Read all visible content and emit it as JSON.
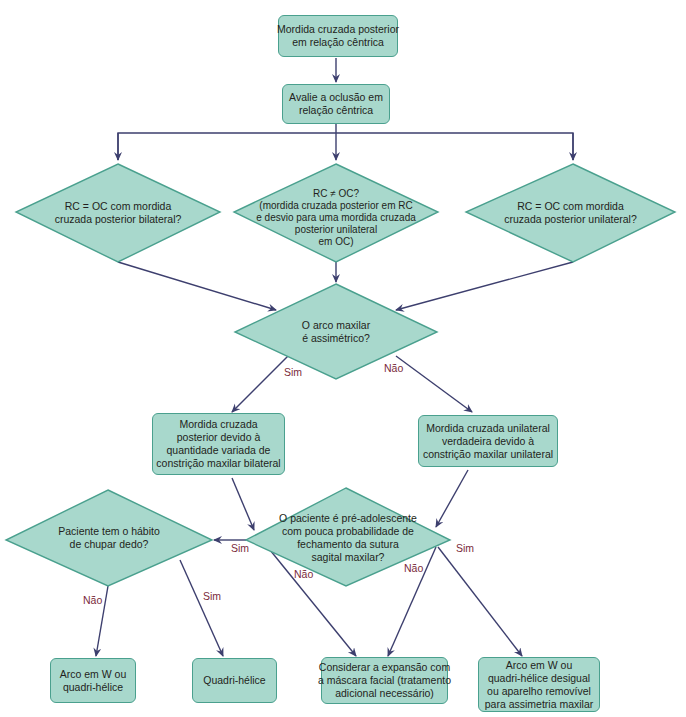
{
  "colors": {
    "node_fill": "#a8d8cc",
    "node_border": "#4aa08e",
    "arrow": "#3d3f6e",
    "label_text": "#7a2a3a"
  },
  "nodes": {
    "start": {
      "lines": [
        "Mordida cruzada posterior",
        "em relação cêntrica"
      ]
    },
    "evaluate": {
      "lines": [
        "Avalie a oclusão em",
        "relação cêntrica"
      ]
    },
    "bilateral_q": {
      "lines": [
        "RC = OC com mordida",
        "cruzada posterior bilateral?"
      ]
    },
    "shift_q": {
      "lines": [
        "RC ≠ OC?",
        "(mordida cruzada posterior em RC",
        "e desvio para uma mordida cruzada",
        "posterior unilateral",
        "em OC)"
      ]
    },
    "unilateral_q": {
      "lines": [
        "RC = OC com mordida",
        "cruzada posterior unilateral?"
      ]
    },
    "asymmetric_q": {
      "lines": [
        "O arco maxilar",
        "é assimétrico?"
      ]
    },
    "bilateral_constriction": {
      "lines": [
        "Mordida cruzada",
        "posterior devido à",
        "quantidade variada de",
        "constrição maxilar bilateral"
      ]
    },
    "unilateral_constriction": {
      "lines": [
        "Mordida cruzada unilateral",
        "verdadeira devido à",
        "constrição maxilar unilateral"
      ]
    },
    "thumb_q": {
      "lines": [
        "Paciente tem o hábito",
        "de chupar dedo?"
      ]
    },
    "preadolescent_q": {
      "lines": [
        "O paciente é pré-adolescente",
        "com pouca probabilidade de",
        "fechamento da sutura",
        "sagital maxilar?"
      ]
    },
    "w_arch": {
      "lines": [
        "Arco em W ou",
        "quadri-hélice"
      ]
    },
    "quad_helix": {
      "lines": [
        "Quadri-hélice"
      ]
    },
    "face_mask": {
      "lines": [
        "Considerar a expansão com",
        "a máscara facial (tratamento",
        "adicional necessário)"
      ]
    },
    "asym_appliance": {
      "lines": [
        "Arco em W ou",
        "quadri-hélice desigual",
        "ou aparelho removível",
        "para assimetria maxilar"
      ]
    }
  },
  "edge_labels": {
    "asym_yes": "Sim",
    "asym_no": "Não",
    "preado_yes_left": "Sim",
    "preado_no_left": "Não",
    "preado_no_right": "Não",
    "preado_yes_right": "Sim",
    "thumb_no": "Não",
    "thumb_yes": "Sim"
  }
}
